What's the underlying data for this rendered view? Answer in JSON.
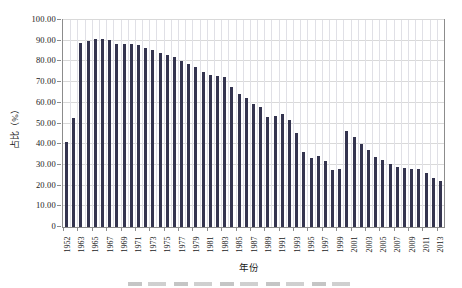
{
  "chart_data": {
    "type": "bar",
    "title": "",
    "xlabel": "年份",
    "ylabel": "占比（%）",
    "ylim": [
      0,
      100
    ],
    "grid": "both",
    "legend": "none",
    "bar_color": "#34344f",
    "grid_color": "#d9d9d9",
    "axis_color": "#8c8c8c",
    "ytick_labels": [
      "100.00",
      "90.00",
      "80.00",
      "70.00",
      "60.00",
      "50.00",
      "40.00",
      "30.00",
      "20.00",
      "10.00",
      "0"
    ],
    "xtick_label_rule": "every second bar labeled, rotated 90 degrees",
    "categories": [
      "1952",
      "1962",
      "1963",
      "1964",
      "1965",
      "1966",
      "1967",
      "1968",
      "1969",
      "1970",
      "1971",
      "1972",
      "1973",
      "1974",
      "1975",
      "1976",
      "1977",
      "1978",
      "1979",
      "1980",
      "1981",
      "1982",
      "1983",
      "1984",
      "1985",
      "1986",
      "1987",
      "1988",
      "1989",
      "1990",
      "1991",
      "1992",
      "1993",
      "1994",
      "1995",
      "1996",
      "1997",
      "1998",
      "1999",
      "2000",
      "2001",
      "2002",
      "2003",
      "2004",
      "2005",
      "2006",
      "2007",
      "2008",
      "2009",
      "2010",
      "2011",
      "2012",
      "2013"
    ],
    "values": [
      41.0,
      52.6,
      88.7,
      89.8,
      90.9,
      90.6,
      90.2,
      88.6,
      88.2,
      88.2,
      87.7,
      86.6,
      85.5,
      84.3,
      83.2,
      82.1,
      80.2,
      78.8,
      77.1,
      74.8,
      73.6,
      72.9,
      72.3,
      67.7,
      64.4,
      62.1,
      59.5,
      58.2,
      53.3,
      53.8,
      54.6,
      51.7,
      45.6,
      36.4,
      33.4,
      34.5,
      31.8,
      27.5,
      27.9,
      46.6,
      43.3,
      40.3,
      37.1,
      33.9,
      32.6,
      30.5,
      29.2,
      28.6,
      28.2,
      27.8,
      26.3,
      23.9,
      22.3
    ]
  }
}
